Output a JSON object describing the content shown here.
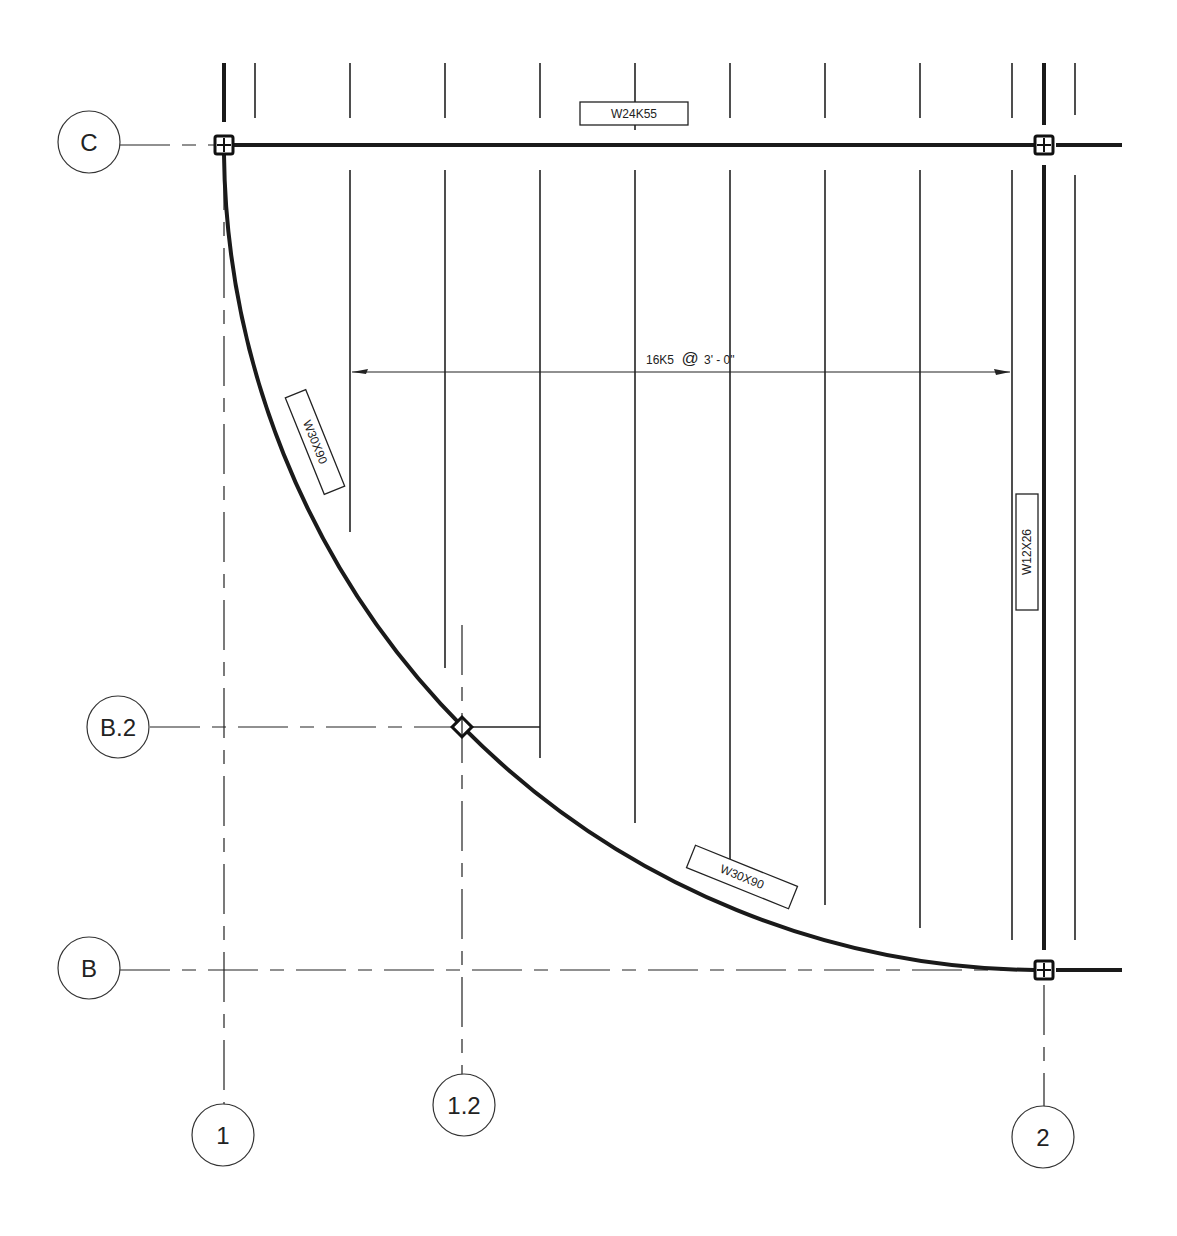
{
  "drawing": {
    "type": "structural framing plan",
    "grid_lines": {
      "horizontal": [
        {
          "label": "C",
          "y": 145
        },
        {
          "label": "B.2",
          "y": 727
        },
        {
          "label": "B",
          "y": 970
        }
      ],
      "vertical": [
        {
          "label": "1",
          "x": 224
        },
        {
          "label": "1.2",
          "x": 462
        },
        {
          "label": "2",
          "x": 1044
        }
      ]
    },
    "beams": {
      "top_beam": "W24K55",
      "curved_beam_upper": "W30X90",
      "curved_beam_lower": "W30X90",
      "right_beam": "W12X26"
    },
    "joist_dimension": {
      "designation": "16K5",
      "at_symbol": "@",
      "spacing": "3' - 0\""
    },
    "colors": {
      "line": "#222222",
      "background": "#ffffff"
    }
  }
}
